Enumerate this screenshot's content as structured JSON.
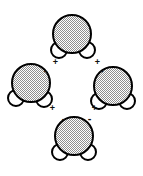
{
  "figure": {
    "type": "diagram",
    "background_color": "#ffffff",
    "oxygen_color": "#b0b0b0",
    "hydrogen_color": "#ffffff",
    "outline_color": "#000000",
    "charge_text_color": "#111111"
  },
  "molecules": [
    {
      "id": "top",
      "label": "water-molecule-top",
      "oxygen": {
        "label": "oxygen-atom",
        "cx": 72,
        "cy": 34,
        "r": 19
      },
      "hydrogens": [
        {
          "label": "hydrogen-atom-left",
          "cx": 59,
          "cy": 50,
          "r": 8
        },
        {
          "label": "hydrogen-atom-right",
          "cx": 87,
          "cy": 50,
          "r": 8
        }
      ]
    },
    {
      "id": "left",
      "label": "water-molecule-left",
      "oxygen": {
        "label": "oxygen-atom",
        "cx": 31,
        "cy": 83,
        "r": 19
      },
      "hydrogens": [
        {
          "label": "hydrogen-atom-left",
          "cx": 16,
          "cy": 98,
          "r": 8
        },
        {
          "label": "hydrogen-atom-right",
          "cx": 44,
          "cy": 99,
          "r": 8
        }
      ]
    },
    {
      "id": "right",
      "label": "water-molecule-right",
      "oxygen": {
        "label": "oxygen-atom",
        "cx": 113,
        "cy": 86,
        "r": 19
      },
      "hydrogens": [
        {
          "label": "hydrogen-atom-left",
          "cx": 99,
          "cy": 101,
          "r": 8
        },
        {
          "label": "hydrogen-atom-right",
          "cx": 127,
          "cy": 101,
          "r": 8
        }
      ]
    },
    {
      "id": "bottom",
      "label": "water-molecule-bottom",
      "oxygen": {
        "label": "oxygen-atom",
        "cx": 74,
        "cy": 136,
        "r": 19
      },
      "hydrogens": [
        {
          "label": "hydrogen-atom-left",
          "cx": 60,
          "cy": 152,
          "r": 8
        },
        {
          "label": "hydrogen-atom-right",
          "cx": 88,
          "cy": 152,
          "r": 8
        }
      ]
    }
  ],
  "charges": [
    {
      "id": "c1",
      "label": "partial-positive-top-left",
      "symbol": "+",
      "x": 51,
      "y": 58
    },
    {
      "id": "c2",
      "label": "partial-positive-top-right",
      "symbol": "+",
      "x": 93,
      "y": 58
    },
    {
      "id": "c3",
      "label": "partial-negative-left-upper",
      "symbol": "-",
      "x": 41,
      "y": 67
    },
    {
      "id": "c4",
      "label": "partial-negative-right-upper",
      "symbol": "-",
      "x": 97,
      "y": 67
    },
    {
      "id": "c5",
      "label": "partial-positive-left-lower",
      "symbol": "+",
      "x": 48,
      "y": 104
    },
    {
      "id": "c6",
      "label": "partial-positive-right-lower",
      "symbol": "+",
      "x": 90,
      "y": 104
    },
    {
      "id": "c7",
      "label": "partial-negative-bottom-left",
      "symbol": "-",
      "x": 59,
      "y": 115
    },
    {
      "id": "c8",
      "label": "partial-negative-bottom-right",
      "symbol": "-",
      "x": 85,
      "y": 115
    }
  ]
}
